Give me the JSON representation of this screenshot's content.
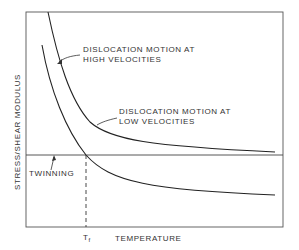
{
  "diagram": {
    "y_axis_label": "STRESS/SHEAR MODULUS",
    "x_axis_label": "TEMPERATURE",
    "tf_label": "T",
    "tf_subscript": "f",
    "curves": {
      "high": {
        "line1": "DISLOCATION MOTION AT",
        "line2": "HIGH VELOCITIES"
      },
      "low": {
        "line1": "DISLOCATION MOTION AT",
        "line2": "LOW VELOCITIES"
      },
      "twinning": "TWINNING"
    },
    "colors": {
      "line": "#333333",
      "background": "#ffffff"
    }
  }
}
